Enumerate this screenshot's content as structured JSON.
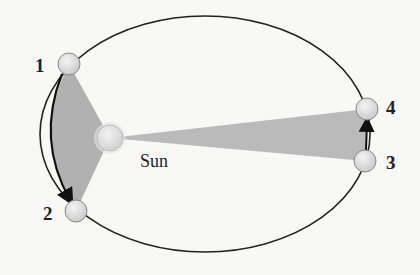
{
  "diagram": {
    "sun_label": "Sun",
    "positions": [
      {
        "label": "1",
        "x": 69,
        "y": 64
      },
      {
        "label": "2",
        "x": 76,
        "y": 211
      },
      {
        "label": "3",
        "x": 365,
        "y": 161
      },
      {
        "label": "4",
        "x": 367,
        "y": 109
      }
    ],
    "colors": {
      "orbit": "#222222",
      "swept_area": "#a9a9a9",
      "planet_fill": "#dcdcdc",
      "sun_fill": "#e4e4e4"
    }
  }
}
